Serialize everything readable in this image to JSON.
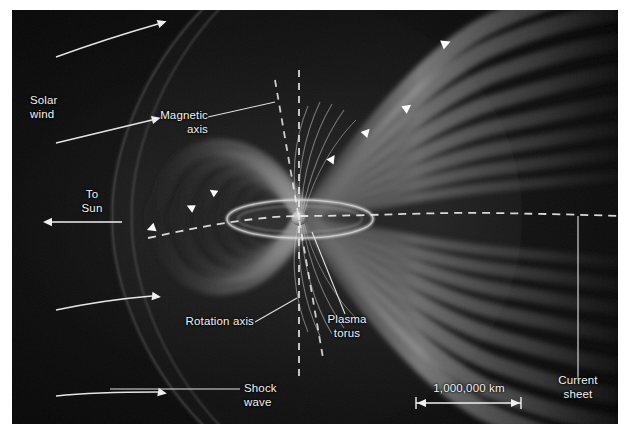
{
  "figure": {
    "background_color": "#050505",
    "border_color": "#ffffff",
    "label_color": "#f2f2f2",
    "line_color": "#d9d9d9",
    "lobe_color": "#8f8f8f",
    "axis_dash_color": "#e8e8e8"
  },
  "labels": {
    "solar_wind": "Solar\nwind",
    "to_sun": "To\nSun",
    "magnetic_axis": "Magnetic\naxis",
    "rotation_axis": "Rotation axis",
    "plasma_torus": "Plasma\ntorus",
    "shock_wave": "Shock\nwave",
    "current_sheet": "Current\nsheet",
    "scale_bar": "1,000,000 km"
  },
  "features": {
    "bow_shock": "bow shock arc",
    "magnetopause": "magnetopause boundary",
    "field_lines_count": 12,
    "arrowheads_dayside": 3,
    "arrowheads_tail": 4,
    "solar_wind_arrows": 4,
    "planet": "Jupiter",
    "plasma_torus_ring": "Io plasma torus"
  },
  "scale": {
    "value": "1,000,000 km",
    "bar_px": 105
  }
}
